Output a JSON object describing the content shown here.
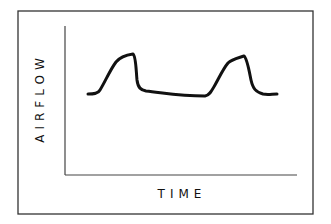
{
  "diagram": {
    "type": "waveform",
    "y_axis_label": "AIRFLOW",
    "x_axis_label": "TIME",
    "colors": {
      "stroke": "#111111",
      "background": "#ffffff",
      "frame": "#333333"
    },
    "waveform": {
      "peaks": 2,
      "pattern": [
        "baseline",
        "peak",
        "baseline",
        "peak",
        "baseline"
      ]
    }
  }
}
